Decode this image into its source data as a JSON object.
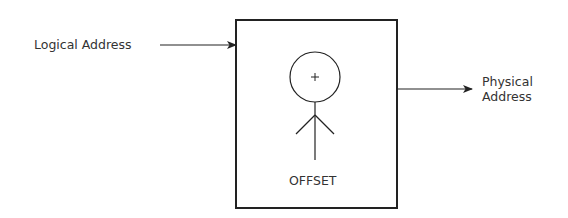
{
  "diagram": {
    "input_label": "Logical Address",
    "output_label_line1": "Physical",
    "output_label_line2": "Address",
    "box_label": "OFFSET",
    "circle_symbol": "+"
  }
}
